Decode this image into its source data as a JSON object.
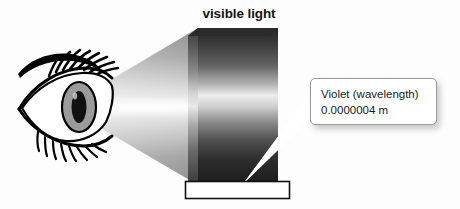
{
  "figure": {
    "title": "visible light",
    "background_color": "#fdfdfd"
  },
  "eye": {
    "label": "eye",
    "iris_color": "#9b9b9b",
    "pupil_color": "#111111",
    "outline_color": "#000000"
  },
  "light_cone": {
    "label": "light-cone",
    "description": "grayscale beam from eye to spectrum block"
  },
  "spectrum_block": {
    "label": "visible light spectrum block",
    "top_color": "#2e2e2e",
    "mid_color": "#e6e6e6",
    "bottom_color": "#1e1e1e"
  },
  "violet_band": {
    "label": "violet band",
    "fill_color": "#ffffff",
    "border_color": "#111111"
  },
  "callout": {
    "line1": "Violet (wavelength)",
    "line2": "0.0000004 m",
    "border_color": "#9a9a9a",
    "background_color": "#ffffff"
  },
  "pointer": {
    "label": "callout-pointer",
    "color": "#ffffff"
  }
}
